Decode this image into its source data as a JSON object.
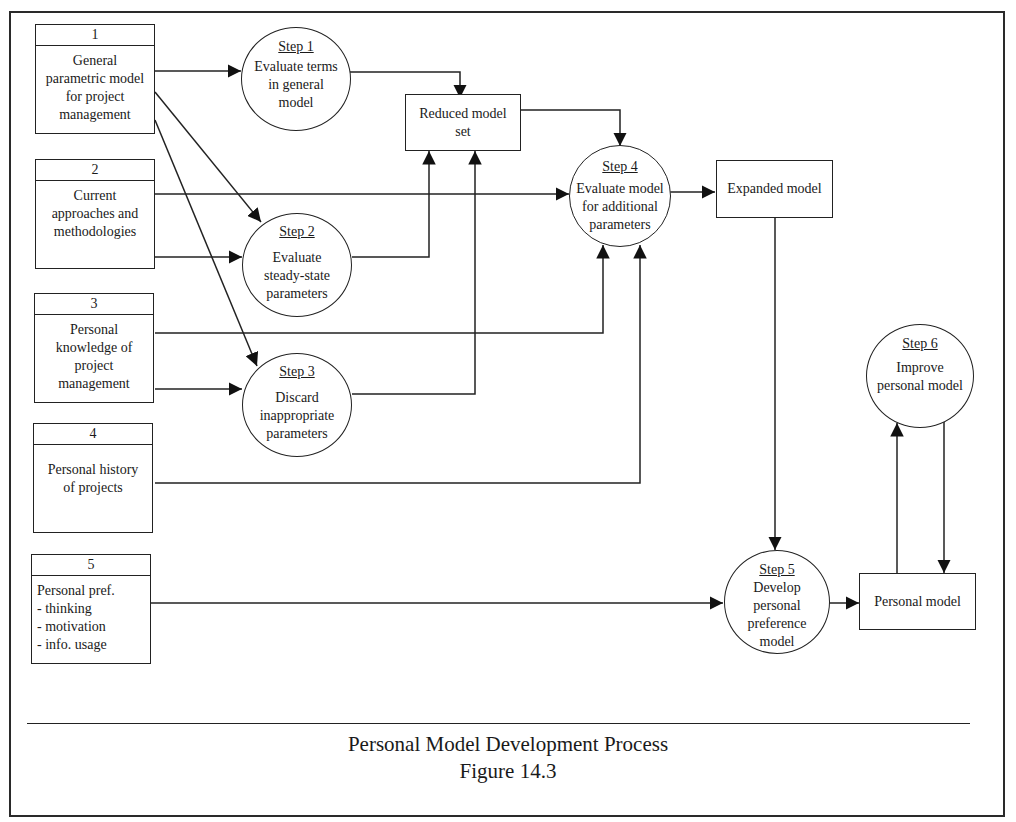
{
  "figure": {
    "title": "Personal Model Development Process",
    "number": "Figure 14.3"
  },
  "sources": [
    {
      "num": "1",
      "lines": [
        "General",
        "parametric model",
        "for project",
        "management"
      ]
    },
    {
      "num": "2",
      "lines": [
        "Current",
        "approaches and",
        "methodologies"
      ]
    },
    {
      "num": "3",
      "lines": [
        "Personal",
        "knowledge of",
        "project",
        "management"
      ]
    },
    {
      "num": "4",
      "lines": [
        "Personal history",
        "of projects"
      ]
    },
    {
      "num": "5",
      "lines": [
        "Personal pref.",
        "- thinking",
        "- motivation",
        "- info. usage"
      ]
    }
  ],
  "steps": [
    {
      "title": "Step 1",
      "lines": [
        "Evaluate terms",
        "in general",
        "model"
      ]
    },
    {
      "title": "Step 2",
      "lines": [
        "Evaluate",
        "steady-state",
        "parameters"
      ]
    },
    {
      "title": "Step 3",
      "lines": [
        "Discard",
        "inappropriate",
        "parameters"
      ]
    },
    {
      "title": "Step 4",
      "lines": [
        "Evaluate model",
        "for additional",
        "parameters"
      ]
    },
    {
      "title": "Step 5",
      "lines": [
        "Develop",
        "personal",
        "preference",
        "model"
      ]
    },
    {
      "title": "Step 6",
      "lines": [
        "Improve",
        "personal model"
      ]
    }
  ],
  "stores": {
    "reduced": [
      "Reduced model",
      "set"
    ],
    "expanded": [
      "Expanded model"
    ],
    "personal": [
      "Personal model"
    ]
  },
  "connections": [
    {
      "from": "Source 1",
      "to": "Step 1"
    },
    {
      "from": "Source 1",
      "to": "Step 2"
    },
    {
      "from": "Source 1",
      "to": "Step 3"
    },
    {
      "from": "Source 2",
      "to": "Step 4"
    },
    {
      "from": "Source 2",
      "to": "Step 2"
    },
    {
      "from": "Source 3",
      "to": "Step 4"
    },
    {
      "from": "Source 3",
      "to": "Step 3"
    },
    {
      "from": "Source 4",
      "to": "Step 4"
    },
    {
      "from": "Source 5",
      "to": "Step 5"
    },
    {
      "from": "Step 1",
      "to": "Reduced model set"
    },
    {
      "from": "Step 2",
      "to": "Reduced model set"
    },
    {
      "from": "Step 3",
      "to": "Reduced model set"
    },
    {
      "from": "Reduced model set",
      "to": "Step 4"
    },
    {
      "from": "Step 4",
      "to": "Expanded model"
    },
    {
      "from": "Expanded model",
      "to": "Step 5"
    },
    {
      "from": "Step 5",
      "to": "Personal model"
    },
    {
      "from": "Personal model",
      "to": "Step 6"
    },
    {
      "from": "Step 6",
      "to": "Personal model"
    }
  ]
}
